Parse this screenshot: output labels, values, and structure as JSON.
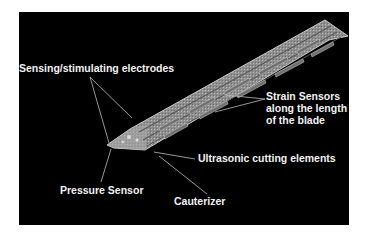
{
  "figure": {
    "background_color": "#000000",
    "label_color": "#f2f2f2",
    "blade_color": "#9a9a9a",
    "labels": {
      "electrodes": "Sensing/stimulating electrodes",
      "strain": "Strain Sensors along the length of the blade",
      "ultrasonic": "Ultrasonic cutting elements",
      "pressure": "Pressure Sensor",
      "cauterizer": "Cauterizer"
    }
  }
}
